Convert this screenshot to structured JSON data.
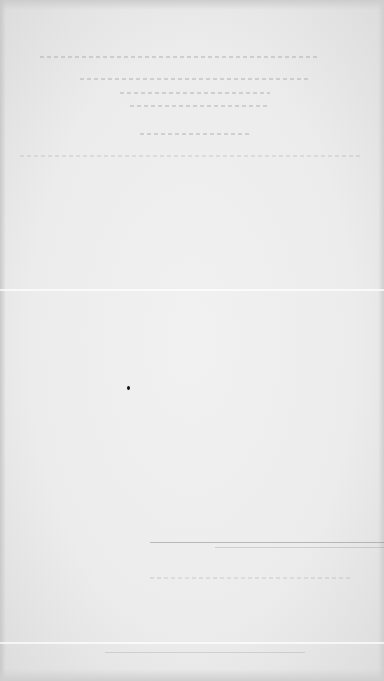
{
  "document": {
    "type": "scanned page",
    "text_legible": false,
    "background_color": "#ececec"
  }
}
